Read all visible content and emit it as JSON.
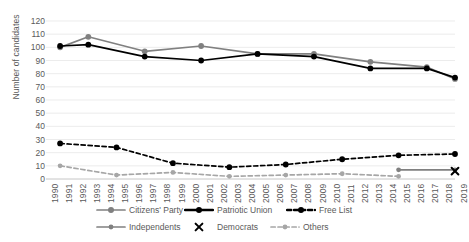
{
  "chart_data": {
    "type": "line",
    "title": "",
    "xlabel": "",
    "ylabel": "Number of candidates",
    "ylim": [
      0,
      120
    ],
    "ytick_step": 10,
    "yticks": [
      0,
      10,
      20,
      30,
      40,
      50,
      60,
      70,
      80,
      90,
      100,
      110,
      120
    ],
    "grid": true,
    "legend_position": "bottom",
    "x": [
      1990,
      1991,
      1992,
      1993,
      1994,
      1995,
      1996,
      1997,
      1998,
      1999,
      2000,
      2001,
      2002,
      2003,
      2004,
      2005,
      2006,
      2007,
      2008,
      2009,
      2010,
      2011,
      2012,
      2013,
      2014,
      2015,
      2016,
      2017,
      2018,
      2019
    ],
    "categories": [
      "1990",
      "1991",
      "1992",
      "1993",
      "1994",
      "1995",
      "1996",
      "1997",
      "1998",
      "1999",
      "2000",
      "2001",
      "2002",
      "2003",
      "2004",
      "2005",
      "2006",
      "2007",
      "2008",
      "2009",
      "2010",
      "2011",
      "2012",
      "2013",
      "2014",
      "2015",
      "2016",
      "2017",
      "2018",
      "2019"
    ],
    "series": [
      {
        "name": "Citizens' Party",
        "color": "#808080",
        "style": "solid",
        "marker": "circle",
        "points": [
          {
            "x": 1991,
            "y": 100
          },
          {
            "x": 1993,
            "y": 108
          },
          {
            "x": 1997,
            "y": 97
          },
          {
            "x": 2001,
            "y": 101
          },
          {
            "x": 2005,
            "y": 95
          },
          {
            "x": 2009,
            "y": 95
          },
          {
            "x": 2013,
            "y": 89
          },
          {
            "x": 2017,
            "y": 85
          },
          {
            "x": 2019,
            "y": 76
          }
        ]
      },
      {
        "name": "Patriotic Union",
        "color": "#000000",
        "style": "solid",
        "marker": "circle",
        "points": [
          {
            "x": 1991,
            "y": 101
          },
          {
            "x": 1993,
            "y": 102
          },
          {
            "x": 1997,
            "y": 93
          },
          {
            "x": 2001,
            "y": 90
          },
          {
            "x": 2005,
            "y": 95
          },
          {
            "x": 2009,
            "y": 93
          },
          {
            "x": 2013,
            "y": 84
          },
          {
            "x": 2017,
            "y": 84
          },
          {
            "x": 2019,
            "y": 77
          }
        ]
      },
      {
        "name": "Free List",
        "color": "#000000",
        "style": "dashed",
        "marker": "circle",
        "points": [
          {
            "x": 1991,
            "y": 27
          },
          {
            "x": 1995,
            "y": 24
          },
          {
            "x": 1999,
            "y": 12
          },
          {
            "x": 2003,
            "y": 9
          },
          {
            "x": 2007,
            "y": 11
          },
          {
            "x": 2011,
            "y": 15
          },
          {
            "x": 2015,
            "y": 18
          },
          {
            "x": 2019,
            "y": 19
          }
        ]
      },
      {
        "name": "Independents",
        "color": "#808080",
        "style": "solid",
        "marker": "circle",
        "points": [
          {
            "x": 2015,
            "y": 7
          },
          {
            "x": 2019,
            "y": 7
          }
        ]
      },
      {
        "name": "Democrats",
        "color": "#000000",
        "style": "none",
        "marker": "x",
        "points": [
          {
            "x": 2019,
            "y": 6
          }
        ]
      },
      {
        "name": "Others",
        "color": "#a6a6a6",
        "style": "dashed",
        "marker": "circle",
        "points": [
          {
            "x": 1991,
            "y": 10
          },
          {
            "x": 1995,
            "y": 3
          },
          {
            "x": 1999,
            "y": 5
          },
          {
            "x": 2003,
            "y": 2
          },
          {
            "x": 2007,
            "y": 3
          },
          {
            "x": 2011,
            "y": 4
          },
          {
            "x": 2015,
            "y": 2
          }
        ]
      }
    ]
  },
  "legend": {
    "items": [
      {
        "label": "Citizens' Party"
      },
      {
        "label": "Patriotic Union"
      },
      {
        "label": "Free List"
      },
      {
        "label": "Independents"
      },
      {
        "label": "Democrats"
      },
      {
        "label": "Others"
      }
    ]
  },
  "axis": {
    "y_title": "Number of candidates"
  }
}
